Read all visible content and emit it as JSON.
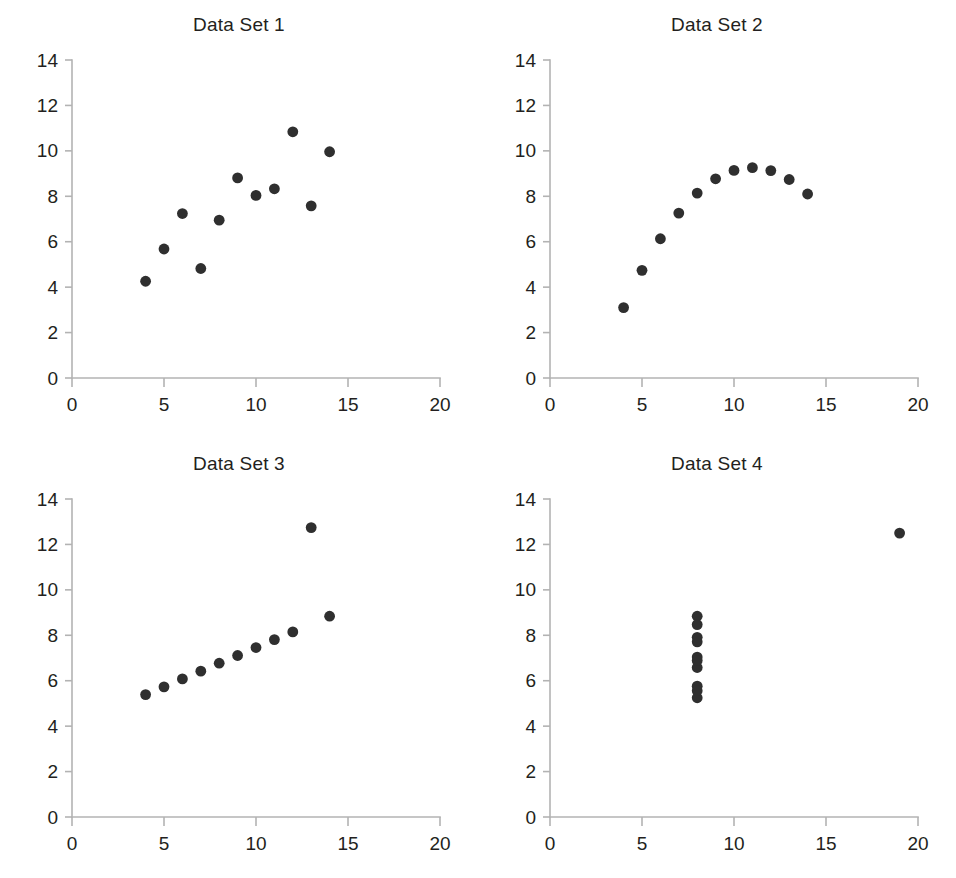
{
  "figure": {
    "name": "anscombes-quartet",
    "background_color": "#ffffff",
    "marker_color": "#2f2f2f",
    "axis_color": "#b3b3b3",
    "text_color": "#231f20"
  },
  "chart_data": [
    {
      "type": "scatter",
      "title": "Data Set 1",
      "xlabel": "",
      "ylabel": "",
      "xlim": [
        0,
        20
      ],
      "ylim": [
        0,
        14
      ],
      "xticks": [
        0,
        5,
        10,
        15,
        20
      ],
      "yticks": [
        0,
        2,
        4,
        6,
        8,
        10,
        12,
        14
      ],
      "xtick_labels": [
        "0",
        "5",
        "10",
        "15",
        "20"
      ],
      "ytick_labels": [
        "0",
        "2",
        "4",
        "6",
        "8",
        "10",
        "12",
        "14"
      ],
      "grid": false,
      "legend": false,
      "x": [
        10,
        8,
        13,
        9,
        11,
        14,
        6,
        4,
        12,
        7,
        5
      ],
      "y": [
        8.04,
        6.95,
        7.58,
        8.81,
        8.33,
        9.96,
        7.24,
        4.26,
        10.84,
        4.82,
        5.68
      ]
    },
    {
      "type": "scatter",
      "title": "Data Set 2",
      "xlabel": "",
      "ylabel": "",
      "xlim": [
        0,
        20
      ],
      "ylim": [
        0,
        14
      ],
      "xticks": [
        0,
        5,
        10,
        15,
        20
      ],
      "yticks": [
        0,
        2,
        4,
        6,
        8,
        10,
        12,
        14
      ],
      "xtick_labels": [
        "0",
        "5",
        "10",
        "15",
        "20"
      ],
      "ytick_labels": [
        "0",
        "2",
        "4",
        "6",
        "8",
        "10",
        "12",
        "14"
      ],
      "grid": false,
      "legend": false,
      "x": [
        10,
        8,
        13,
        9,
        11,
        14,
        6,
        4,
        12,
        7,
        5
      ],
      "y": [
        9.14,
        8.14,
        8.74,
        8.77,
        9.26,
        8.1,
        6.13,
        3.1,
        9.13,
        7.26,
        4.74
      ]
    },
    {
      "type": "scatter",
      "title": "Data Set 3",
      "xlabel": "",
      "ylabel": "",
      "xlim": [
        0,
        20
      ],
      "ylim": [
        0,
        14
      ],
      "xticks": [
        0,
        5,
        10,
        15,
        20
      ],
      "yticks": [
        0,
        2,
        4,
        6,
        8,
        10,
        12,
        14
      ],
      "xtick_labels": [
        "0",
        "5",
        "10",
        "15",
        "20"
      ],
      "ytick_labels": [
        "0",
        "2",
        "4",
        "6",
        "8",
        "10",
        "12",
        "14"
      ],
      "grid": false,
      "legend": false,
      "x": [
        10,
        8,
        13,
        9,
        11,
        14,
        6,
        4,
        12,
        7,
        5
      ],
      "y": [
        7.46,
        6.77,
        12.74,
        7.11,
        7.81,
        8.84,
        6.08,
        5.39,
        8.15,
        6.42,
        5.73
      ]
    },
    {
      "type": "scatter",
      "title": "Data Set 4",
      "xlabel": "",
      "ylabel": "",
      "xlim": [
        0,
        20
      ],
      "ylim": [
        0,
        14
      ],
      "xticks": [
        0,
        5,
        10,
        15,
        20
      ],
      "yticks": [
        0,
        2,
        4,
        6,
        8,
        10,
        12,
        14
      ],
      "xtick_labels": [
        "0",
        "5",
        "10",
        "15",
        "20"
      ],
      "ytick_labels": [
        "0",
        "2",
        "4",
        "6",
        "8",
        "10",
        "12",
        "14"
      ],
      "grid": false,
      "legend": false,
      "x": [
        8,
        8,
        8,
        8,
        8,
        8,
        8,
        19,
        8,
        8,
        8
      ],
      "y": [
        6.58,
        5.76,
        7.71,
        8.84,
        8.47,
        7.04,
        5.25,
        12.5,
        5.56,
        7.91,
        6.89
      ]
    }
  ]
}
